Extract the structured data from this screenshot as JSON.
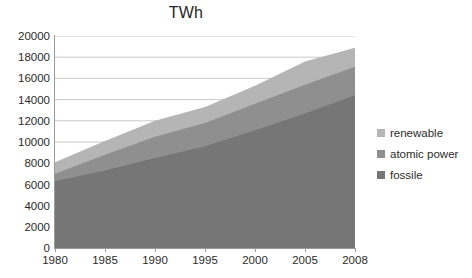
{
  "chart_data": {
    "type": "area",
    "stacked": true,
    "title": "TWh",
    "xlabel": "",
    "ylabel": "",
    "x": [
      1980,
      1985,
      1990,
      1995,
      2000,
      2005,
      2008
    ],
    "categories": [
      "1980",
      "1985",
      "1990",
      "1995",
      "2000",
      "2005",
      "2008"
    ],
    "xtick_labels": [
      "1980",
      "1985",
      "1990",
      "1995",
      "2000",
      "2005",
      "2008"
    ],
    "ytick_labels": [
      "20000",
      "18000",
      "16000",
      "14000",
      "12000",
      "10000",
      "8000",
      "6000",
      "4000",
      "2000",
      "0"
    ],
    "ylim": [
      0,
      20000
    ],
    "ytick_step": 2000,
    "grid": true,
    "grid_axis": "y",
    "legend_position": "right",
    "series": [
      {
        "name": "fossile",
        "color": "#767676",
        "values": [
          6300,
          7300,
          8500,
          9600,
          11100,
          12700,
          14400
        ]
      },
      {
        "name": "atomic power",
        "color": "#8f8f8f",
        "values": [
          700,
          1500,
          2000,
          2200,
          2500,
          2700,
          2700
        ]
      },
      {
        "name": "renewable",
        "color": "#b5b5b5",
        "values": [
          1100,
          1300,
          1500,
          1500,
          1700,
          2200,
          1800
        ]
      }
    ],
    "cumulative_tops": {
      "fossile": [
        6300,
        7300,
        8500,
        9600,
        11100,
        12700,
        14400
      ],
      "atomic_power": [
        7000,
        8800,
        10500,
        11800,
        13600,
        15400,
        17100
      ],
      "renewable": [
        8100,
        10100,
        12000,
        13300,
        15300,
        17600,
        18900
      ]
    }
  },
  "legend": {
    "items": [
      {
        "label": "renewable",
        "color": "#b5b5b5"
      },
      {
        "label": "atomic power",
        "color": "#8f8f8f"
      },
      {
        "label": "fossile",
        "color": "#767676"
      }
    ]
  }
}
